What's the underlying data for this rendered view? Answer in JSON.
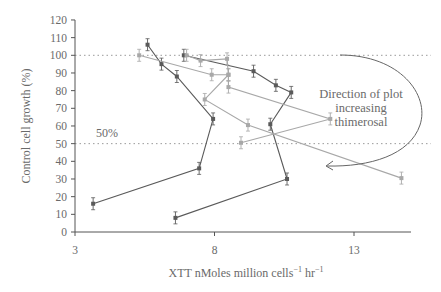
{
  "chart_data": {
    "type": "line",
    "title": "",
    "xlabel": "XTT nMoles million cells",
    "xlabel_sup1": "−1",
    "xlabel_mid": " hr",
    "xlabel_sup2": "−1",
    "ylabel": "Control cell growth (%)",
    "xlim": [
      3,
      15
    ],
    "ylim": [
      0,
      120
    ],
    "x_ticks": [
      3,
      8,
      13
    ],
    "y_ticks": [
      0,
      10,
      20,
      30,
      40,
      50,
      60,
      70,
      80,
      90,
      100,
      110,
      120
    ],
    "reference_lines": [
      {
        "y": 100,
        "style": "dotted"
      },
      {
        "y": 50,
        "style": "dotted",
        "label": "50%"
      }
    ],
    "annotation": {
      "text_lines": [
        "Direction of plot",
        "increasing",
        "thimerosal"
      ],
      "arrow": "curved, clockwise from 100% line down to ~37%"
    },
    "series": [
      {
        "name": "series-1",
        "color": "#5a5a5a",
        "points": [
          [
            5.6,
            106
          ],
          [
            6.1,
            95
          ],
          [
            6.65,
            88
          ],
          [
            7.95,
            64
          ],
          [
            7.45,
            36
          ],
          [
            3.65,
            16
          ]
        ]
      },
      {
        "name": "series-2",
        "color": "#5a5a5a",
        "points": [
          [
            6.9,
            100
          ],
          [
            9.4,
            91
          ],
          [
            10.2,
            83
          ],
          [
            10.75,
            79
          ],
          [
            10.0,
            61
          ],
          [
            10.6,
            30
          ],
          [
            6.6,
            8
          ]
        ]
      },
      {
        "name": "series-3",
        "color": "#a8a8a8",
        "points": [
          [
            5.3,
            100
          ],
          [
            7.9,
            89
          ],
          [
            8.5,
            89
          ],
          [
            8.5,
            82
          ],
          [
            12.15,
            64
          ],
          [
            8.95,
            50.5
          ]
        ]
      },
      {
        "name": "series-4",
        "color": "#a8a8a8",
        "points": [
          [
            7.0,
            100
          ],
          [
            7.5,
            97
          ],
          [
            8.45,
            98
          ],
          [
            8.5,
            89
          ],
          [
            7.65,
            75
          ],
          [
            9.2,
            60.5
          ],
          [
            14.7,
            30.5
          ]
        ]
      }
    ]
  }
}
